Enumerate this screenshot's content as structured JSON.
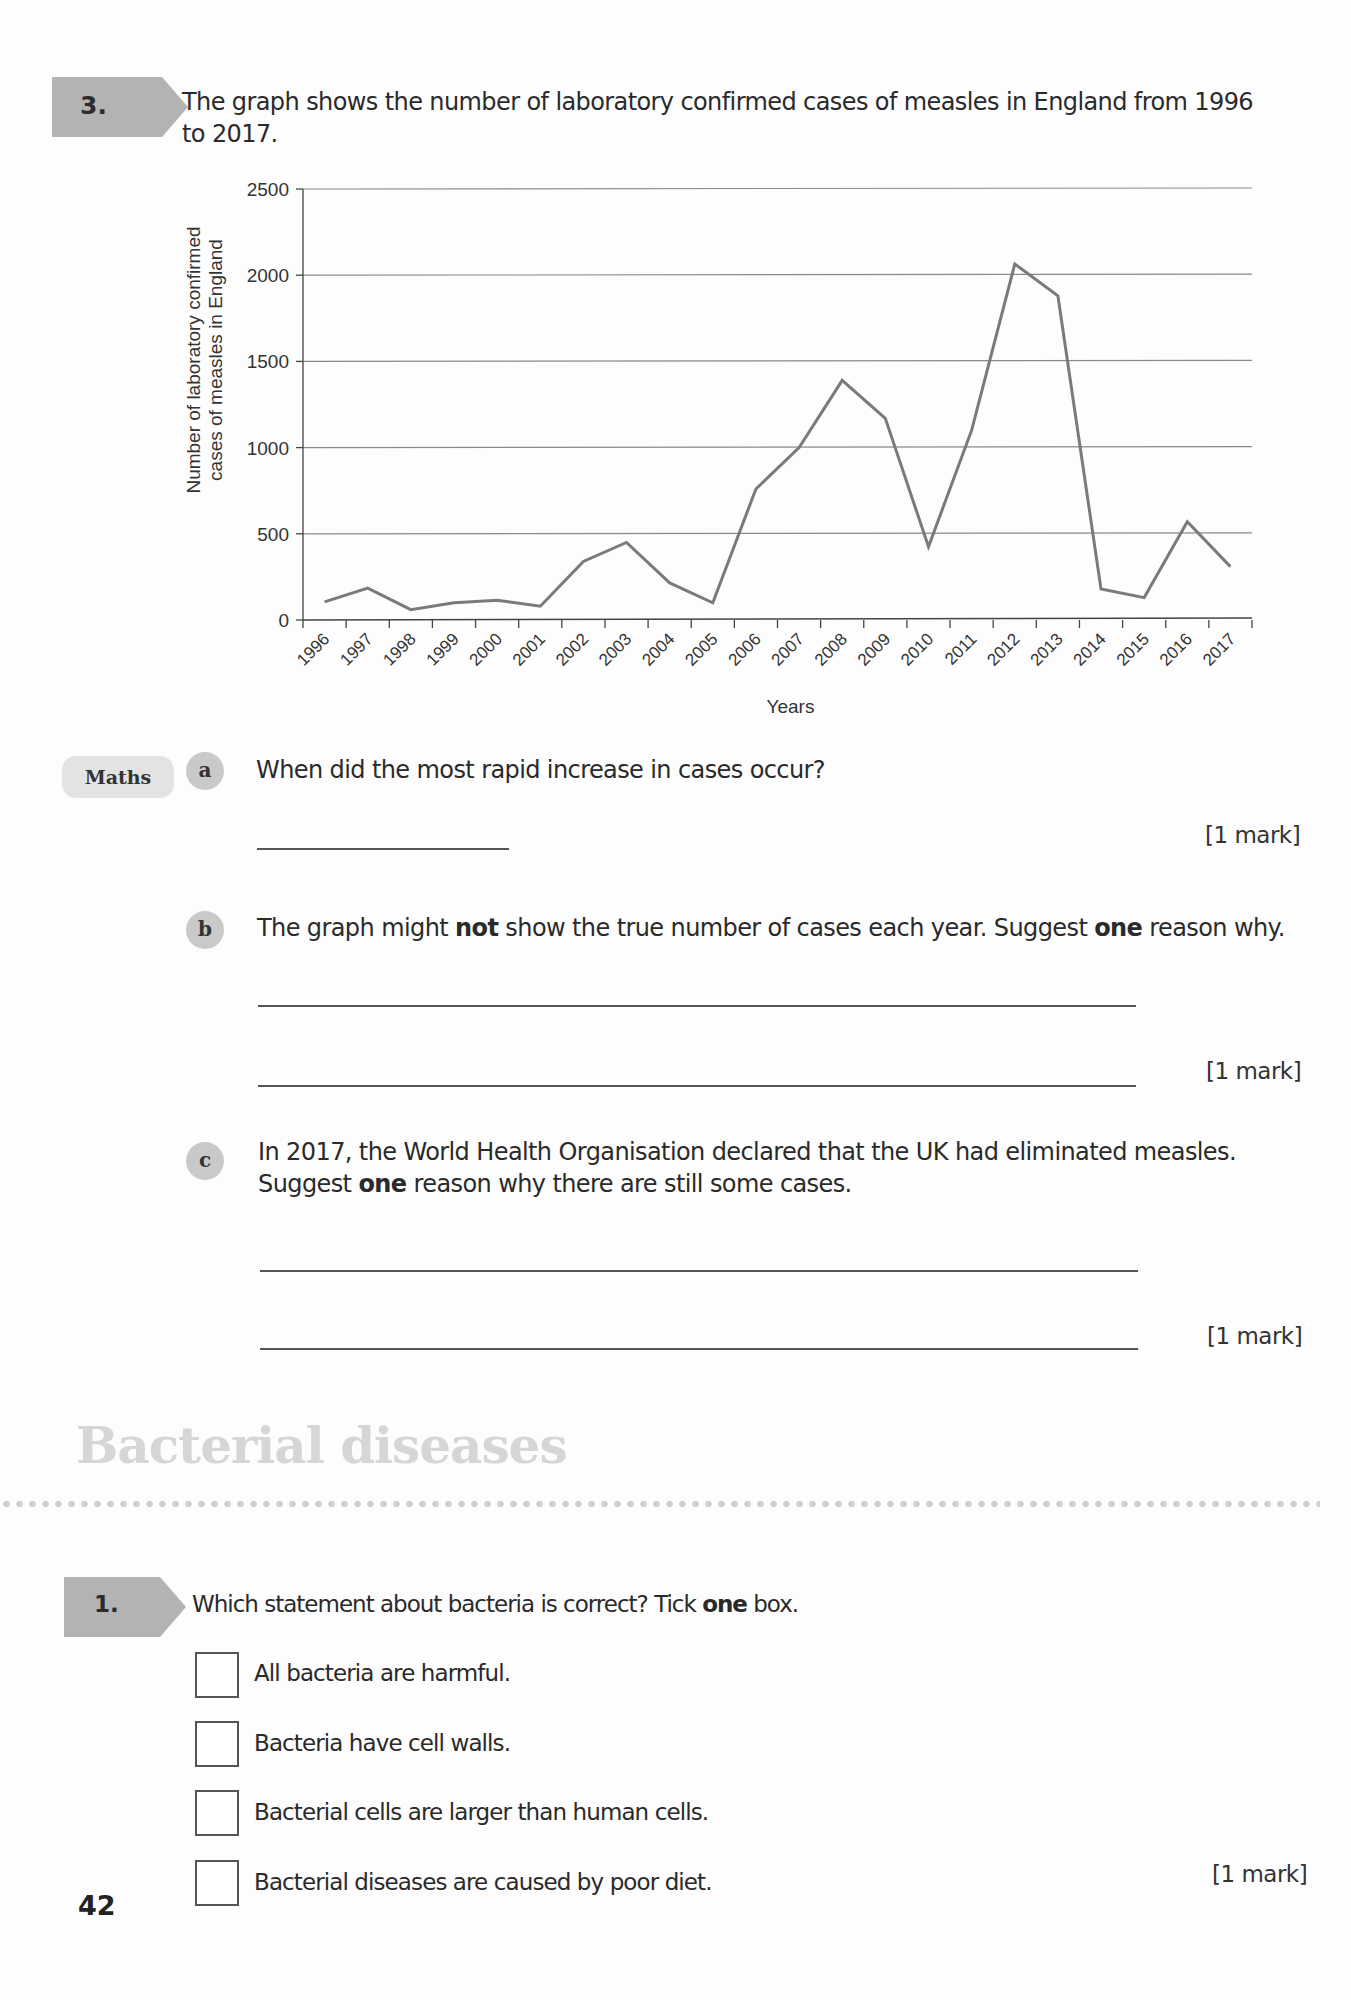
{
  "question3": {
    "number": "3.",
    "prompt_line1": "The graph shows the number of laboratory confirmed cases of measles in England from 1996",
    "prompt_line2": "to 2017.",
    "skill_tag": "Maths",
    "parts": [
      {
        "letter": "a",
        "text": "When did the most rapid increase in cases occur?",
        "mark": "[1 mark]"
      },
      {
        "letter": "b",
        "text_pre": "The graph might ",
        "text_bold": "not",
        "text_mid": " show the true number of cases each year. Suggest ",
        "text_bold2": "one",
        "text_post": " reason why.",
        "mark": "[1 mark]"
      },
      {
        "letter": "c",
        "line1": "In 2017, the World Health Organisation declared that the UK had eliminated measles.",
        "line2_pre": "Suggest ",
        "line2_bold": "one",
        "line2_post": " reason why there are still some cases.",
        "mark": "[1 mark]"
      }
    ]
  },
  "chart_data": {
    "type": "line",
    "title": "",
    "xlabel": "Years",
    "ylabel": "Number of laboratory confirmed cases of measles in England",
    "ylabel_line1": "Number of laboratory confirmed",
    "ylabel_line2": "cases of measles in England",
    "ylim": [
      0,
      2500
    ],
    "yticks": [
      0,
      500,
      1000,
      1500,
      2000,
      2500
    ],
    "grid": true,
    "legend": null,
    "categories": [
      "1996",
      "1997",
      "1998",
      "1999",
      "2000",
      "2001",
      "2002",
      "2003",
      "2004",
      "2005",
      "2006",
      "2007",
      "2008",
      "2009",
      "2010",
      "2011",
      "2012",
      "2013",
      "2014",
      "2015",
      "2016",
      "2017"
    ],
    "values": [
      105,
      185,
      60,
      100,
      115,
      80,
      340,
      450,
      215,
      100,
      760,
      1000,
      1390,
      1170,
      425,
      1100,
      2065,
      1880,
      180,
      130,
      570,
      310
    ],
    "line_color": "#7a7a7a"
  },
  "section": {
    "title": "Bacterial diseases"
  },
  "question1": {
    "number": "1.",
    "prompt_pre": "Which statement about bacteria is correct? Tick ",
    "prompt_bold": "one",
    "prompt_post": " box.",
    "options": [
      "All bacteria are harmful.",
      "Bacteria have cell walls.",
      "Bacterial cells are larger than human cells.",
      "Bacterial diseases are caused by poor diet."
    ],
    "mark": "[1 mark]"
  },
  "page_number": "42"
}
